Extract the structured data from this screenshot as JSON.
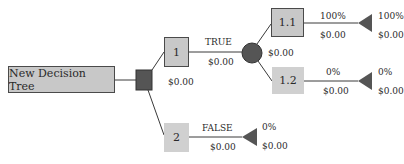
{
  "tree": {
    "root": {
      "label": "New Decision Tree"
    },
    "decision_node": {
      "type": "decision",
      "color": "#555555"
    },
    "branches": [
      {
        "id": "1",
        "label": "1",
        "edge_label": "TRUE",
        "edge_value": "$0.00",
        "node_value": "$0.00",
        "chance_node": {
          "type": "chance",
          "color": "#555555",
          "value": "$0.00",
          "outcomes": [
            {
              "id": "1.1",
              "label": "1.1",
              "probability": "100%",
              "value": "$0.00",
              "terminal_probability": "100%",
              "terminal_value": "$0.00"
            },
            {
              "id": "1.2",
              "label": "1.2",
              "probability": "0%",
              "value": "$0.00",
              "terminal_probability": "0%",
              "terminal_value": "$0.00"
            }
          ]
        }
      },
      {
        "id": "2",
        "label": "2",
        "edge_label": "FALSE",
        "edge_value": "$0.00",
        "terminal_probability": "0%",
        "terminal_value": "$0.00"
      }
    ]
  },
  "colors": {
    "box_fill": "#c8c8c8",
    "node_dark": "#555555",
    "line": "#3a3a3a"
  }
}
